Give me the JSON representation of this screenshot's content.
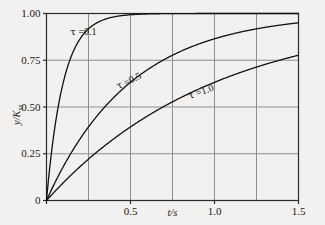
{
  "chart_data": {
    "type": "line",
    "title": "",
    "xlabel": "t/s",
    "ylabel": "y/Kss",
    "xlim": [
      0,
      1.5
    ],
    "ylim": [
      0,
      1.0
    ],
    "grid": true,
    "legend_position": "inline-annotations",
    "x_ticks": [
      {
        "value": 0,
        "label": "0"
      },
      {
        "value": 0.5,
        "label": "0.5"
      },
      {
        "value": 1.0,
        "label": "1.0"
      },
      {
        "value": 1.5,
        "label": "1.5"
      }
    ],
    "y_ticks": [
      {
        "value": 0,
        "label": "0"
      },
      {
        "value": 0.25,
        "label": "0.25"
      },
      {
        "value": 0.5,
        "label": "0.50"
      },
      {
        "value": 0.75,
        "label": "0.75"
      },
      {
        "value": 1.0,
        "label": "1.00"
      }
    ],
    "gridlines": {
      "x": [
        0.25,
        0.5,
        0.75,
        1.0,
        1.25
      ],
      "y": [
        0.25,
        0.5,
        0.75
      ]
    },
    "x": [
      0,
      0.05,
      0.1,
      0.15,
      0.2,
      0.25,
      0.3,
      0.35,
      0.4,
      0.45,
      0.5,
      0.6,
      0.7,
      0.8,
      0.9,
      1.0,
      1.1,
      1.2,
      1.3,
      1.4,
      1.5
    ],
    "series": [
      {
        "name": "tau = 0.1",
        "tau": 0.1,
        "label": "=0.1",
        "color": "#111111",
        "values": [
          0,
          0.393,
          0.632,
          0.777,
          0.865,
          0.918,
          0.95,
          0.97,
          0.982,
          0.989,
          0.993,
          0.998,
          0.999,
          1.0,
          1.0,
          1.0,
          1.0,
          1.0,
          1.0,
          1.0,
          1.0
        ]
      },
      {
        "name": "tau = 0.5",
        "tau": 0.5,
        "label": "=0.5",
        "color": "#111111",
        "values": [
          0,
          0.095,
          0.181,
          0.259,
          0.33,
          0.393,
          0.451,
          0.503,
          0.551,
          0.593,
          0.632,
          0.699,
          0.753,
          0.798,
          0.835,
          0.865,
          0.889,
          0.909,
          0.925,
          0.939,
          0.95
        ]
      },
      {
        "name": "tau = 1.0",
        "tau": 1.0,
        "label": "=1.0",
        "color": "#111111",
        "values": [
          0,
          0.049,
          0.095,
          0.139,
          0.181,
          0.221,
          0.259,
          0.295,
          0.33,
          0.362,
          0.393,
          0.451,
          0.503,
          0.551,
          0.593,
          0.632,
          0.667,
          0.699,
          0.727,
          0.753,
          0.777
        ]
      }
    ],
    "annotations": [
      {
        "text": "=0.1",
        "symbol": "τ",
        "x": 0.22,
        "y": 0.9,
        "rotation": 0
      },
      {
        "text": "=0.5",
        "symbol": "τ",
        "x": 0.49,
        "y": 0.64,
        "rotation": -26
      },
      {
        "text": "=1.0",
        "symbol": "τ",
        "x": 0.92,
        "y": 0.58,
        "rotation": -20
      }
    ],
    "colors": {
      "curve": "#111111",
      "axis": "#2a2a2a",
      "grid": "#8e8e8e",
      "background": "#f2f1ef",
      "text": "#1a1a1a"
    }
  }
}
